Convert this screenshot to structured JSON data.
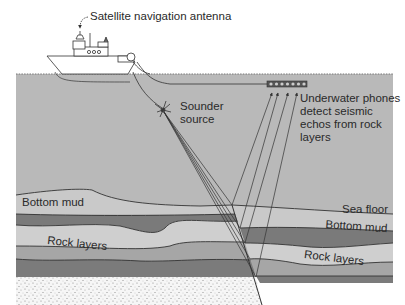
{
  "figure": {
    "type": "seismic-survey-cross-section",
    "colors": {
      "water": "#b9b9b9",
      "mud_light": "#c6c6c6",
      "rock_dark": "#7e7e7e",
      "rock_mid": "#a4a4a4",
      "rock_light": "#cdcdcd",
      "bedrock_speckle": "#f4f4f4",
      "line": "#333333"
    }
  },
  "labels": {
    "antenna": "Satellite navigation antenna",
    "sounder": "Sounder\nsource",
    "phones": "Underwater phones\ndetect seismic\nechos from rock\nlayers",
    "bottom_mud_left": "Bottom mud",
    "rock_layers_left": "Rock layers",
    "sea_floor": "Sea floor",
    "bottom_mud_right": "Bottom mud",
    "rock_layers_right": "Rock layers"
  }
}
